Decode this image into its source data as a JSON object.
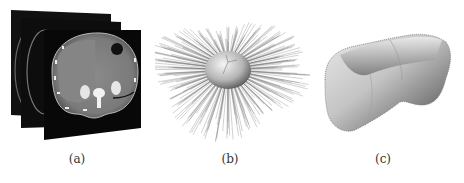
{
  "figure": {
    "panels": [
      {
        "id": "a",
        "caption": "(a)",
        "description": "stacked axial CT slices of abdomen"
      },
      {
        "id": "b",
        "caption": "(b)",
        "description": "ellipsoid initial shape with radial search rays"
      },
      {
        "id": "c",
        "caption": "(c)",
        "description": "3D rendered liver surface segmentation"
      }
    ]
  }
}
